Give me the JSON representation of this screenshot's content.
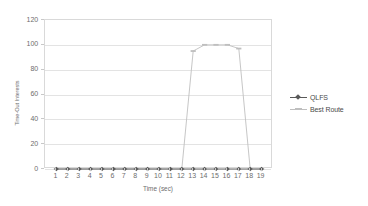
{
  "chart_data": {
    "type": "line",
    "title": "",
    "xlabel": "Time (sec)",
    "ylabel": "Time-Out Interests",
    "xlim": [
      0,
      20
    ],
    "ylim": [
      0,
      120
    ],
    "grid": true,
    "legend_position": "right",
    "x": [
      1,
      2,
      3,
      4,
      5,
      6,
      7,
      8,
      9,
      10,
      11,
      12,
      13,
      14,
      15,
      16,
      17,
      18,
      19
    ],
    "xtick_labels": [
      "1",
      "2",
      "3",
      "4",
      "5",
      "6",
      "7",
      "8",
      "9",
      "10",
      "11",
      "12",
      "13",
      "14",
      "15",
      "16",
      "17",
      "18",
      "19"
    ],
    "ytick_labels": [
      "0",
      "20",
      "40",
      "60",
      "80",
      "100",
      "120"
    ],
    "ytick_values": [
      0,
      20,
      40,
      60,
      80,
      100,
      120
    ],
    "series": [
      {
        "name": "QLFS",
        "color": "#595959",
        "marker": "diamond",
        "values": [
          0,
          0,
          0,
          0,
          0,
          0,
          0,
          0,
          0,
          0,
          0,
          0,
          0,
          0,
          0,
          0,
          0,
          0,
          0
        ]
      },
      {
        "name": "Best Route",
        "color": "#bfbfbf",
        "marker": "dash",
        "values": [
          0,
          0,
          0,
          0,
          0,
          0,
          0,
          0,
          0,
          0,
          0,
          0,
          95,
          100,
          100,
          100,
          97,
          0,
          0
        ]
      }
    ]
  },
  "legend": {
    "entries": [
      {
        "label": "QLFS"
      },
      {
        "label": "Best Route"
      }
    ]
  },
  "colors": {
    "qlfs": "#595959",
    "best_route": "#bfbfbf",
    "grid": "#e3e3e3",
    "frame": "#d9d9d9",
    "text": "#6d6d6d",
    "background": "#ffffff"
  }
}
